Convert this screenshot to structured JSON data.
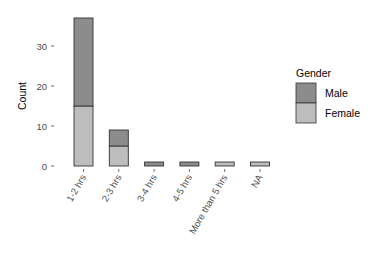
{
  "chart_data": {
    "type": "bar",
    "stacked": true,
    "title": "",
    "xlabel": "",
    "ylabel": "Count",
    "ylim": [
      0,
      38
    ],
    "yticks": [
      0,
      10,
      20,
      30
    ],
    "grid": false,
    "categories": [
      "1-2 hrs",
      "2-3 hrs",
      "3-4 hrs",
      "4-5 hrs",
      "More than 5 hrs",
      "NA"
    ],
    "series": [
      {
        "name": "Male",
        "color": "#8c8c8c",
        "values": [
          22,
          4,
          1,
          1,
          0,
          0
        ]
      },
      {
        "name": "Female",
        "color": "#bdbdbd",
        "values": [
          15,
          5,
          0,
          0,
          1,
          1
        ]
      }
    ],
    "legend": {
      "title": "Gender",
      "position": "right",
      "entries": [
        "Male",
        "Female"
      ]
    }
  }
}
